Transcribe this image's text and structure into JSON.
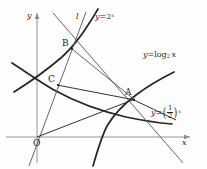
{
  "figure": {
    "type": "math-coordinate-diagram",
    "background_color": "#fdfdfd",
    "stroke_color": "#262626",
    "axis_color": "#888888",
    "axes": {
      "x_label": "x",
      "y_label": "y",
      "origin_label": "O"
    },
    "labels": {
      "line_l": "l",
      "curve_exp2_prefix": "y",
      "curve_exp2_eq": "=",
      "curve_exp2_base": "2",
      "curve_exp2_exp": "x",
      "curve_log_prefix": "y",
      "curve_log_eq": "=",
      "curve_log_fn": "log",
      "curve_log_base": "2",
      "curve_log_arg": "x",
      "curve_half_prefix": "y",
      "curve_half_eq": "=",
      "curve_half_num": "1",
      "curve_half_den": "2",
      "curve_half_exp": "x",
      "paren_open": "(",
      "paren_close": ")"
    },
    "points": [
      {
        "name": "A",
        "label": "A",
        "x": 133,
        "y": 100
      },
      {
        "name": "B",
        "label": "B",
        "x": 72,
        "y": 48
      },
      {
        "name": "C",
        "label": "C",
        "x": 57,
        "y": 83
      },
      {
        "name": "O",
        "label": "O",
        "x": 37,
        "y": 137
      }
    ],
    "curves": [
      {
        "name": "y=2^x",
        "id": "curve-exp2"
      },
      {
        "name": "y=log2 x",
        "id": "curve-log2"
      },
      {
        "name": "y=(1/2)^x",
        "id": "curve-half"
      }
    ],
    "lines": [
      {
        "name": "line-l",
        "id": "line-l"
      },
      {
        "name": "segment-OA",
        "id": "seg-oa"
      },
      {
        "name": "segment-CA",
        "id": "seg-ca"
      },
      {
        "name": "segment-BA",
        "id": "seg-ba"
      },
      {
        "name": "ray-through-B",
        "id": "ray-b"
      }
    ]
  }
}
